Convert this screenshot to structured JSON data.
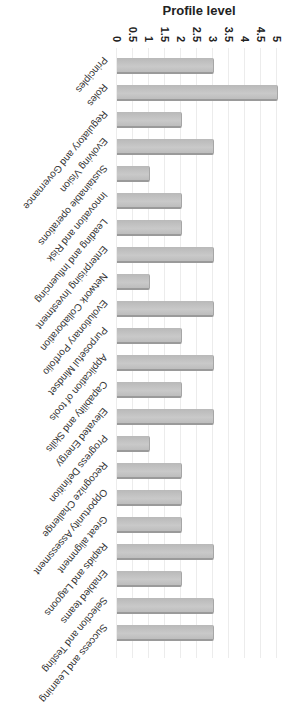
{
  "chart_data": {
    "type": "bar",
    "title": "",
    "xlabel": "",
    "ylabel": "Profile level",
    "ylim": [
      0,
      5
    ],
    "yticks": [
      "0",
      "0.5",
      "1",
      "1.5",
      "2",
      "2.5",
      "3",
      "3.5",
      "4",
      "4.5",
      "5"
    ],
    "grid": true,
    "orientation_note": "figure rotated 90 degrees clockwise",
    "categories": [
      "Principles",
      "Roles",
      "Regulatory and Governance",
      "Evolving Vision",
      "Sustainable operations",
      "Innovation and Risk",
      "Leading and Influencing",
      "Enterprising Investment",
      "Network Collaboration",
      "Evolutionary Portfolio",
      "Purposeful Mindset",
      "Application of tools",
      "Capability and Skills",
      "Elevated Energy",
      "Progress Definition",
      "Recognize Challenge",
      "Opportunity Assessment",
      "Great alignment",
      "Rapids and Lagoons",
      "Enabled teams",
      "Selection and Testing",
      "Success and Learning"
    ],
    "values": [
      3,
      5,
      2,
      3,
      1,
      2,
      2,
      3,
      1,
      3,
      2,
      3,
      2,
      3,
      1,
      2,
      2,
      2,
      3,
      2,
      3,
      3
    ],
    "bar_color": "#c2c2c2"
  }
}
